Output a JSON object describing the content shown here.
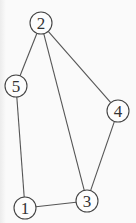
{
  "graph": {
    "node_radius": 11,
    "nodes": [
      {
        "id": "1",
        "label": "1",
        "x": 25,
        "y": 208
      },
      {
        "id": "2",
        "label": "2",
        "x": 41,
        "y": 23
      },
      {
        "id": "3",
        "label": "3",
        "x": 87,
        "y": 201
      },
      {
        "id": "4",
        "label": "4",
        "x": 118,
        "y": 111
      },
      {
        "id": "5",
        "label": "5",
        "x": 16,
        "y": 86
      }
    ],
    "edges": [
      {
        "from": "2",
        "to": "5"
      },
      {
        "from": "2",
        "to": "3"
      },
      {
        "from": "2",
        "to": "4"
      },
      {
        "from": "5",
        "to": "1"
      },
      {
        "from": "1",
        "to": "3"
      },
      {
        "from": "3",
        "to": "4"
      }
    ]
  },
  "colors": {
    "background": "#fafafa",
    "edge": "#555555",
    "node_stroke": "#444444",
    "label": "#333333"
  }
}
